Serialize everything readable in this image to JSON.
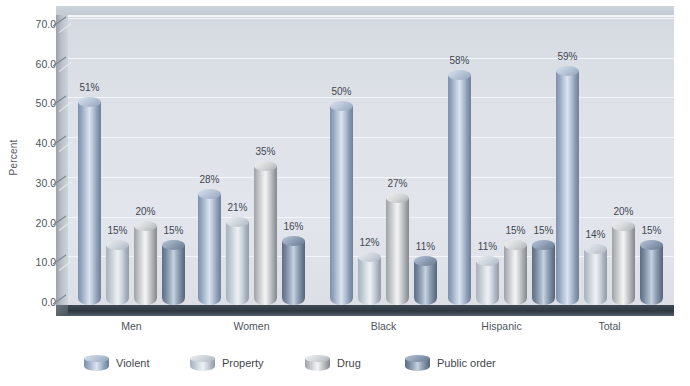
{
  "chart_data": {
    "type": "bar",
    "title": "",
    "xlabel": "",
    "ylabel": "Percent",
    "ylim": [
      0,
      70
    ],
    "ytick_labels": [
      "0.0",
      "10.0",
      "20.0",
      "30.0",
      "40.0",
      "50.0",
      "60.0",
      "70.0"
    ],
    "yticks": [
      0,
      10,
      20,
      30,
      40,
      50,
      60,
      70
    ],
    "grid": true,
    "legend_position": "bottom",
    "categories": [
      "Men",
      "Women",
      "Black",
      "Hispanic",
      "Total"
    ],
    "series": [
      {
        "name": "Violent",
        "values": [
          51,
          28,
          50,
          58,
          59
        ],
        "labels": [
          "51%",
          "28%",
          "50%",
          "58%",
          "59%"
        ],
        "color": "#9aabc4"
      },
      {
        "name": "Property",
        "values": [
          15,
          21,
          12,
          11,
          14
        ],
        "labels": [
          "15%",
          "21%",
          "12%",
          "11%",
          "14%"
        ],
        "color": "#c3cbd6"
      },
      {
        "name": "Drug",
        "values": [
          20,
          35,
          27,
          15,
          20
        ],
        "labels": [
          "20%",
          "35%",
          "27%",
          "15%",
          "20%"
        ],
        "color": "#cfd2d4"
      },
      {
        "name": "Public order",
        "values": [
          15,
          16,
          11,
          15,
          15
        ],
        "labels": [
          "15%",
          "16%",
          "11%",
          "15%",
          "15%"
        ],
        "color": "#7f91a8"
      }
    ]
  },
  "legend": {
    "items": [
      {
        "label": "Violent"
      },
      {
        "label": "Property"
      },
      {
        "label": "Drug"
      },
      {
        "label": "Public order"
      }
    ]
  },
  "colors": {
    "plot_background": "#dfe3e9",
    "floor": "#2f3841",
    "gridline": "#f3f6f9",
    "text": "#4e555c"
  }
}
